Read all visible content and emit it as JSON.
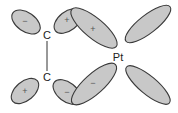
{
  "diagram": {
    "title": "",
    "atoms": {
      "carbon_top": "C",
      "carbon_bottom": "C",
      "metal": "Pt"
    },
    "lobes": {
      "c_top_left": {
        "sign": "−"
      },
      "c_top_right": {
        "sign": "+"
      },
      "c_bottom_left": {
        "sign": "+"
      },
      "c_bottom_right": {
        "sign": "−"
      },
      "pt_upper_left": {
        "sign": "+"
      },
      "pt_lower_left": {
        "sign": "−"
      },
      "pt_upper_right": {
        "sign": ""
      },
      "pt_lower_right": {
        "sign": ""
      }
    },
    "colors": {
      "lobe_fill": "#c8c8c8",
      "lobe_stroke": "#3a3a3a",
      "text": "#222222"
    }
  }
}
